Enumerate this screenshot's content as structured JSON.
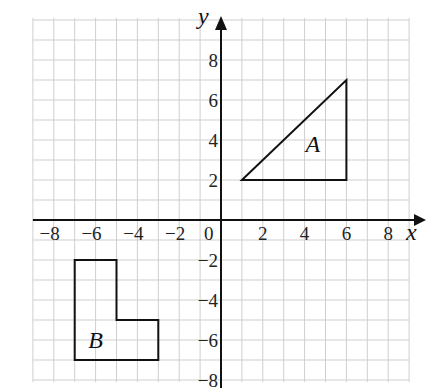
{
  "figure": {
    "x_axis_label": "x",
    "y_axis_label": "y",
    "x_ticks": [
      {
        "value": -8,
        "label": "−8"
      },
      {
        "value": -6,
        "label": "−6"
      },
      {
        "value": -4,
        "label": "−4"
      },
      {
        "value": -2,
        "label": "−2"
      },
      {
        "value": 2,
        "label": "2"
      },
      {
        "value": 4,
        "label": "4"
      },
      {
        "value": 6,
        "label": "6"
      },
      {
        "value": 8,
        "label": "8"
      }
    ],
    "y_ticks": [
      {
        "value": 8,
        "label": "8"
      },
      {
        "value": 6,
        "label": "6"
      },
      {
        "value": 4,
        "label": "4"
      },
      {
        "value": 2,
        "label": "2"
      },
      {
        "value": -2,
        "label": "−2"
      },
      {
        "value": -4,
        "label": "−4"
      },
      {
        "value": -6,
        "label": "−6"
      },
      {
        "value": -8,
        "label": "−8"
      }
    ],
    "origin_label": "0",
    "x_range": [
      -9,
      9
    ],
    "y_range": [
      -8,
      10
    ],
    "grid": true,
    "colors": {
      "grid": "#cfcfcf",
      "axes": "#111111",
      "shapes": "#111111",
      "background": "#ffffff"
    },
    "shapes": [
      {
        "name": "A",
        "label": "A",
        "type": "triangle",
        "vertices": [
          [
            1,
            2
          ],
          [
            6,
            2
          ],
          [
            6,
            7
          ]
        ],
        "label_position": [
          4.4,
          3.4
        ]
      },
      {
        "name": "B",
        "label": "B",
        "type": "L-shape",
        "vertices": [
          [
            -7,
            -2
          ],
          [
            -5,
            -2
          ],
          [
            -5,
            -5
          ],
          [
            -3,
            -5
          ],
          [
            -3,
            -7
          ],
          [
            -7,
            -7
          ]
        ],
        "label_position": [
          -6.0,
          -6.4
        ]
      }
    ]
  }
}
